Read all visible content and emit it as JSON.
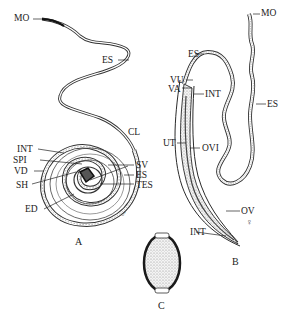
{
  "figure": {
    "panels": [
      {
        "id": "A",
        "label": "A",
        "sex_symbol": "♂",
        "description": "male worm (coiled)"
      },
      {
        "id": "B",
        "label": "B",
        "sex_symbol": "♀",
        "description": "female worm"
      },
      {
        "id": "C",
        "label": "C",
        "description": "egg"
      }
    ],
    "labels_A": {
      "mo": "MO",
      "es_top": "ES",
      "cl": "CL",
      "int": "INT",
      "spi": "SPI",
      "vd": "VD",
      "sh": "SH",
      "ed": "ED",
      "sv": "SV",
      "es": "ES",
      "tes": "TES"
    },
    "labels_B": {
      "mo": "MO",
      "es_top": "ES",
      "es_right": "ES",
      "vu": "VU",
      "va": "VA",
      "int_top": "INT",
      "ut": "UT",
      "ovi": "OVI",
      "ov": "OV",
      "int_bottom": "INT"
    },
    "colors": {
      "line": "#2a2a2a",
      "stipple": "#9a9a9a",
      "background": "#ffffff"
    }
  }
}
